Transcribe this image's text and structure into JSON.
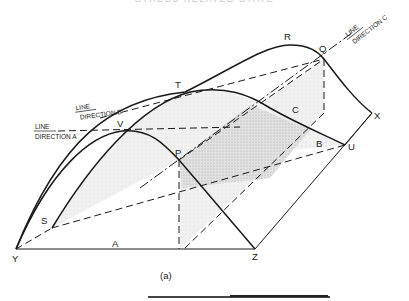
{
  "header": {
    "text": "STRESS RELATED STATE"
  },
  "figure": {
    "caption": "(a)",
    "point_labels": {
      "R": "R",
      "Q": "Q",
      "T": "T",
      "V": "V",
      "P": "P",
      "S": "S",
      "U": "U",
      "X": "X",
      "Y": "Y",
      "Z": "Z"
    },
    "region_labels": {
      "A": "A",
      "B": "B",
      "C": "C"
    },
    "line_direction_labels": {
      "a": {
        "line": "LINE",
        "direction": "DIRECTION A"
      },
      "b": {
        "line": "LINE",
        "direction": "DIRECTION B"
      },
      "c": {
        "line": "LINE",
        "direction": "DIRECTION C"
      }
    },
    "colors": {
      "ink": "#1a1a1a",
      "light_shade": "#ececec",
      "dark_shade": "#d2d2d2"
    }
  }
}
